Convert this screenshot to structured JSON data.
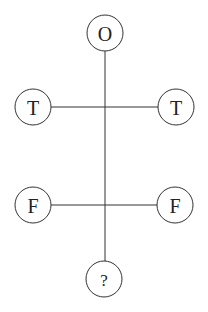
{
  "diagram": {
    "type": "tree-puzzle",
    "nodes": {
      "top": {
        "label": "O"
      },
      "row1_left": {
        "label": "T"
      },
      "row1_right": {
        "label": "T"
      },
      "row2_left": {
        "label": "F"
      },
      "row2_right": {
        "label": "F"
      },
      "bottom": {
        "label": "?"
      }
    },
    "edges": [
      {
        "from": "top",
        "to": "bottom",
        "orientation": "vertical"
      },
      {
        "from": "row1_left",
        "to": "row1_right",
        "orientation": "horizontal"
      },
      {
        "from": "row2_left",
        "to": "row2_right",
        "orientation": "horizontal"
      }
    ],
    "colors": {
      "stroke": "#333333",
      "background": "#ffffff"
    }
  }
}
